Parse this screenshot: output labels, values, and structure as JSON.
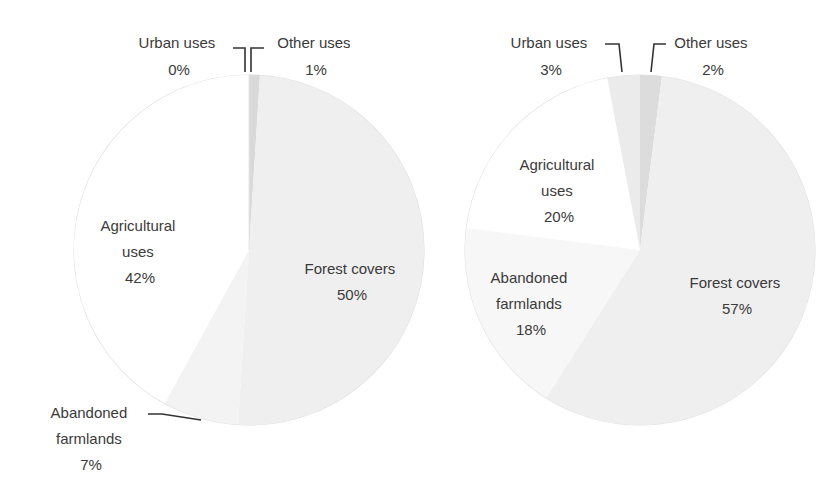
{
  "chart_data": [
    {
      "type": "pie",
      "title": "",
      "slices": [
        {
          "label": "Other uses",
          "value": 1,
          "display": "1%",
          "color": "#d9d9d9"
        },
        {
          "label": "Forest covers",
          "value": 50,
          "display": "50%",
          "color": "#efefef"
        },
        {
          "label": "Abandoned farmlands",
          "value": 7,
          "display": "7%",
          "color": "#f3f3f3"
        },
        {
          "label": "Agricultural uses",
          "value": 42,
          "display": "42%",
          "color": "#ffffff"
        },
        {
          "label": "Urban uses",
          "value": 0,
          "display": "0%",
          "color": "#e6e6e6"
        }
      ],
      "labels": [
        {
          "lines": [
            "Urban uses",
            "0%"
          ]
        },
        {
          "lines": [
            "Other uses",
            "1%"
          ]
        },
        {
          "lines": [
            "Agricultural",
            "uses",
            "42%"
          ]
        },
        {
          "lines": [
            "Forest covers",
            "50%"
          ]
        },
        {
          "lines": [
            "Abandoned",
            "farmlands",
            "7%"
          ]
        }
      ]
    },
    {
      "type": "pie",
      "title": "",
      "slices": [
        {
          "label": "Other uses",
          "value": 2,
          "display": "2%",
          "color": "#dcdcdc"
        },
        {
          "label": "Forest covers",
          "value": 57,
          "display": "57%",
          "color": "#efefef"
        },
        {
          "label": "Abandoned farmlands",
          "value": 18,
          "display": "18%",
          "color": "#f7f7f7"
        },
        {
          "label": "Agricultural uses",
          "value": 20,
          "display": "20%",
          "color": "#ffffff"
        },
        {
          "label": "Urban uses",
          "value": 3,
          "display": "3%",
          "color": "#ebebeb"
        }
      ],
      "labels": [
        {
          "lines": [
            "Urban uses",
            "3%"
          ]
        },
        {
          "lines": [
            "Other uses",
            "2%"
          ]
        },
        {
          "lines": [
            "Agricultural",
            "uses",
            "20%"
          ]
        },
        {
          "lines": [
            "Abandoned",
            "farmlands",
            "18%"
          ]
        },
        {
          "lines": [
            "Forest covers",
            "57%"
          ]
        }
      ]
    }
  ]
}
